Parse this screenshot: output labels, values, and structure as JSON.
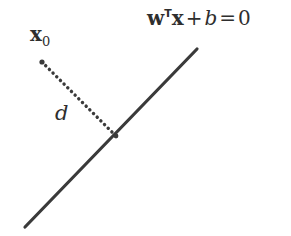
{
  "figure": {
    "background_color": "#ffffff",
    "ink_color": "#3a3a3a",
    "text_color": "#2e2e2e",
    "width": 291,
    "height": 236
  },
  "labels": {
    "hyperplane_equation": {
      "vector_w": "w",
      "transpose": "T",
      "vector_x": "x",
      "plus": "+",
      "bias": "b",
      "equals": "=",
      "rhs": "0",
      "full_text": "wᵀx + b = 0"
    },
    "point": {
      "symbol": "x",
      "subscript": "0",
      "full_text": "x₀"
    },
    "distance": {
      "symbol": "d"
    }
  },
  "geometry": {
    "hyperplane_line": {
      "x1": 25,
      "y1": 227,
      "x2": 197,
      "y2": 49,
      "stroke_width": 3.2,
      "style": "solid"
    },
    "distance_segment": {
      "x1": 42,
      "y1": 62,
      "x2": 116,
      "y2": 136,
      "stroke_width": 3.4,
      "style": "dotted",
      "dash_gap": 5.1
    },
    "point_x0": {
      "cx": 42,
      "cy": 62,
      "r": 2.6
    },
    "point_foot": {
      "cx": 116,
      "cy": 136,
      "r": 2.4
    }
  }
}
